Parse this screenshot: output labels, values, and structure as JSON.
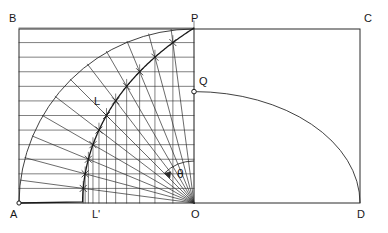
{
  "figure": {
    "stroke_color": "#2b2b2b",
    "curve_color": "#1a1a1a",
    "background": "#ffffff"
  },
  "labels": {
    "A": "A",
    "B": "B",
    "C": "C",
    "D": "D",
    "O": "O",
    "P": "P",
    "Q": "Q",
    "L": "L",
    "L_prime": "L'",
    "theta": "θ"
  },
  "chart_data": {
    "type": "diagram",
    "geometry": {
      "rectangle": {
        "A": [
          19,
          203
        ],
        "B": [
          19,
          29
        ],
        "C": [
          360,
          29
        ],
        "D": [
          360,
          203
        ]
      },
      "center_O": [
        194,
        203
      ],
      "top_P": [
        194,
        29
      ],
      "radius": 175,
      "quadratrix_endpoint_Q": [
        194,
        91.6
      ],
      "divisions": 12,
      "angle_step_degrees": 7.5,
      "theta_arc_radius": 42,
      "right_arc": {
        "from": [
          194,
          91.6
        ],
        "to": [
          360,
          203
        ],
        "kind": "elliptical-quarter"
      }
    },
    "point_labels": [
      "A",
      "B",
      "C",
      "D",
      "O",
      "P",
      "Q",
      "L",
      "L'",
      "θ"
    ]
  }
}
